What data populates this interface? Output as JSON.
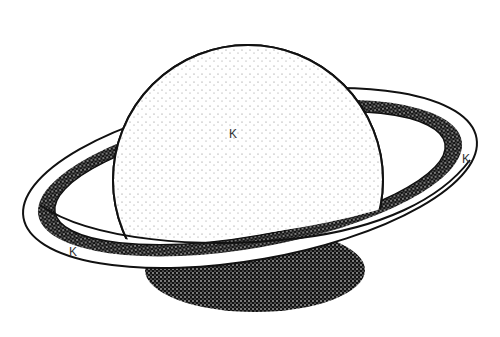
{
  "diagram": {
    "labels": [
      {
        "text": "K",
        "x": 229,
        "y": 127,
        "target": "planet-body"
      },
      {
        "text": "K",
        "x": 462,
        "y": 152,
        "target": "ring-right"
      },
      {
        "text": "K",
        "x": 69,
        "y": 245,
        "target": "ring-left"
      }
    ]
  },
  "colors": {
    "ink": "#111111",
    "background": "#ffffff"
  }
}
